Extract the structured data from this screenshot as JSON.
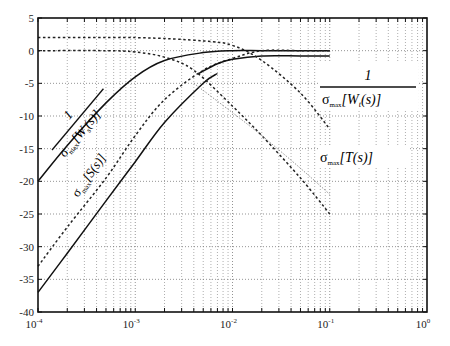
{
  "chart_data": {
    "type": "line",
    "title": "",
    "xlabel": "",
    "ylabel": "",
    "xscale": "log",
    "xlim": [
      0.0001,
      1
    ],
    "ylim": [
      -40,
      5
    ],
    "grid": true,
    "x_ticks": [
      "10^-4",
      "10^-3",
      "10^-2",
      "10^-1",
      "10^0"
    ],
    "y_ticks": [
      5,
      0,
      -5,
      -10,
      -15,
      -20,
      -25,
      -30,
      -35,
      -40
    ],
    "annotations": [
      {
        "text": "1 / σmax[Ws(s)]",
        "position": "left, rotated along curve"
      },
      {
        "text": "σmax[S(s)]",
        "position": "center-left, rotated along curve"
      },
      {
        "text": "1 / σmax[Wt(s)]",
        "position": "right, upper"
      },
      {
        "text": "σmax[T(s)]",
        "position": "right, middle"
      }
    ],
    "series": [
      {
        "name": "1/σmax[Ws(s)]",
        "style": "solid",
        "x": [
          0.0001,
          0.0002,
          0.0005,
          0.001,
          0.002,
          0.005,
          0.01,
          0.02,
          0.05,
          0.1
        ],
        "y": [
          -20,
          -14.5,
          -8,
          -4,
          -1.5,
          -0.3,
          0,
          0,
          0,
          0
        ]
      },
      {
        "name": "σmax[S(s)] (dashed)",
        "style": "dashed",
        "x": [
          0.0001,
          0.0002,
          0.0005,
          0.001,
          0.002,
          0.005,
          0.01,
          0.02,
          0.05,
          0.1
        ],
        "y": [
          -33,
          -27,
          -19.5,
          -13,
          -7.5,
          -3,
          -1.2,
          0,
          0,
          0
        ]
      },
      {
        "name": "σmax[S(s)] (solid)",
        "style": "solid",
        "x": [
          0.0001,
          0.0002,
          0.0005,
          0.001,
          0.002,
          0.005,
          0.007
        ],
        "y": [
          -37,
          -31,
          -23,
          -17,
          -11,
          -5,
          -3.5
        ]
      },
      {
        "name": "σmax[S(s)] upper branch",
        "style": "solid",
        "x": [
          0.0045,
          0.007,
          0.01,
          0.02,
          0.05,
          0.1
        ],
        "y": [
          -3.5,
          -2,
          -1.3,
          -0.8,
          -0.8,
          -0.8
        ]
      },
      {
        "name": "1/σmax[Wt(s)]",
        "style": "dashed",
        "x": [
          0.0001,
          0.001,
          0.005,
          0.01,
          0.02,
          0.05,
          0.1
        ],
        "y": [
          2,
          2,
          1.5,
          0.8,
          -1.5,
          -6.5,
          -12
        ]
      },
      {
        "name": "σmax[T(s)] (dashed)",
        "style": "dashed",
        "x": [
          0.0001,
          0.0005,
          0.001,
          0.002,
          0.004,
          0.01,
          0.02,
          0.05,
          0.1
        ],
        "y": [
          0,
          0,
          -0.2,
          -1,
          -3,
          -8.5,
          -13,
          -19.5,
          -25
        ]
      },
      {
        "name": "σmax[T(s)] (faint)",
        "style": "dotted",
        "x": [
          0.004,
          0.01,
          0.02,
          0.05,
          0.1
        ],
        "y": [
          -5,
          -9.5,
          -13,
          -18,
          -22
        ]
      }
    ]
  },
  "labels": {
    "ws_num": "1",
    "ws_den": "σ",
    "ws_den_sub": "max",
    "ws_den_rest": "[W",
    "ws_den_sub2": "s",
    "ws_den_end": "(s)]",
    "s_sigma": "σ",
    "s_sub": "max",
    "s_rest": "[S(s)]",
    "wt_num": "1",
    "wt_sigma": "σ",
    "wt_sub": "max",
    "wt_rest": "[W",
    "wt_sub2": "t",
    "wt_end": "(s)]",
    "t_sigma": "σ",
    "t_sub": "max",
    "t_rest": "[T(s)]"
  },
  "axis": {
    "y_labels": [
      "5",
      "0",
      "-5",
      "-10",
      "-15",
      "-20",
      "-25",
      "-30",
      "-35",
      "-40"
    ],
    "x_labels": [
      {
        "base": "10",
        "exp": "-4"
      },
      {
        "base": "10",
        "exp": "-3"
      },
      {
        "base": "10",
        "exp": "-2"
      },
      {
        "base": "10",
        "exp": "-1"
      },
      {
        "base": "10",
        "exp": "0"
      }
    ]
  }
}
